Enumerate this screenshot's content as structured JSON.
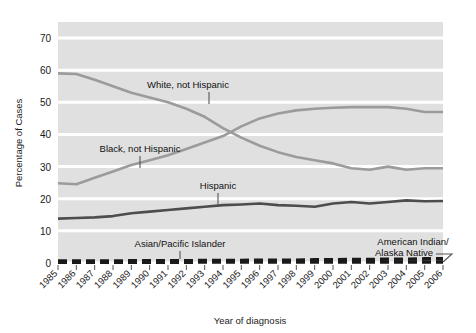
{
  "chart_data": {
    "type": "line",
    "title": "",
    "xlabel": "Year of diagnosis",
    "ylabel": "Percentage of Cases",
    "xlim": [
      1985,
      2006
    ],
    "ylim": [
      0,
      75
    ],
    "yticks": [
      0,
      10,
      20,
      30,
      40,
      50,
      60,
      70
    ],
    "grid": true,
    "legend_position": "inline-annotations",
    "categories": [
      "1985",
      "1986",
      "1987",
      "1988",
      "1989",
      "1990",
      "1991",
      "1992",
      "1993",
      "1994",
      "1995",
      "1996",
      "1997",
      "1998",
      "1999",
      "2000",
      "2001",
      "2002",
      "2003",
      "2004",
      "2005",
      "2006"
    ],
    "series": [
      {
        "name": "White, not Hispanic",
        "color": "#9b9b9b",
        "values": [
          59.0,
          58.8,
          57.0,
          55.0,
          53.0,
          51.5,
          50.0,
          48.0,
          45.5,
          42.0,
          39.0,
          36.5,
          34.5,
          33.0,
          32.0,
          31.0,
          29.5,
          29.0,
          30.0,
          29.0,
          29.5,
          29.5
        ]
      },
      {
        "name": "Black, not Hispanic",
        "color": "#9b9b9b",
        "values": [
          24.8,
          24.5,
          26.5,
          28.5,
          30.5,
          32.0,
          33.5,
          35.5,
          37.5,
          39.5,
          42.5,
          45.0,
          46.5,
          47.5,
          48.0,
          48.3,
          48.5,
          48.5,
          48.5,
          48.0,
          47.0,
          47.0
        ]
      },
      {
        "name": "Hispanic",
        "color": "#4d4d4d",
        "values": [
          13.8,
          14.0,
          14.2,
          14.6,
          15.5,
          16.0,
          16.5,
          17.0,
          17.5,
          18.0,
          18.2,
          18.5,
          18.0,
          17.8,
          17.5,
          18.5,
          19.0,
          18.5,
          19.0,
          19.5,
          19.2,
          19.3
        ]
      },
      {
        "name": "Asian/Pacific Islander",
        "color": "#1a1a1a",
        "values": [
          0.6,
          0.6,
          0.6,
          0.6,
          0.7,
          0.7,
          0.7,
          0.7,
          0.8,
          0.8,
          0.8,
          0.9,
          0.9,
          0.9,
          1.0,
          1.0,
          1.1,
          1.1,
          1.2,
          1.2,
          1.3,
          1.3
        ]
      },
      {
        "name": "American Indian/Alaska Native",
        "color": "#1a1a1a",
        "values": [
          0.2,
          0.2,
          0.2,
          0.2,
          0.2,
          0.2,
          0.2,
          0.2,
          0.3,
          0.3,
          0.3,
          0.3,
          0.3,
          0.3,
          0.3,
          0.3,
          0.3,
          0.3,
          0.3,
          0.3,
          0.3,
          0.3
        ]
      }
    ],
    "annotations": [
      {
        "text": "White, not Hispanic",
        "series": "White, not Hispanic"
      },
      {
        "text": "Black, not Hispanic",
        "series": "Black, not Hispanic"
      },
      {
        "text": "Hispanic",
        "series": "Hispanic"
      },
      {
        "text": "Asian/Pacific Islander",
        "series": "Asian/Pacific Islander"
      },
      {
        "text": "American Indian/",
        "series": "American Indian/Alaska Native"
      },
      {
        "text": "Alaska Native",
        "series": "American Indian/Alaska Native"
      }
    ]
  },
  "labels": {
    "y_axis_title": "Percentage of Cases",
    "x_axis_title": "Year of diagnosis",
    "ytick_0": "0",
    "ytick_10": "10",
    "ytick_20": "20",
    "ytick_30": "30",
    "ytick_40": "40",
    "ytick_50": "50",
    "ytick_60": "60",
    "ytick_70": "70",
    "series_white": "White, not Hispanic",
    "series_black": "Black, not Hispanic",
    "series_hispanic": "Hispanic",
    "series_asian": "Asian/Pacific Islander",
    "series_ai_line1": "American Indian/",
    "series_ai_line2": "Alaska Native",
    "year_1985": "1985",
    "year_1986": "1986",
    "year_1987": "1987",
    "year_1988": "1988",
    "year_1989": "1989",
    "year_1990": "1990",
    "year_1991": "1991",
    "year_1992": "1992",
    "year_1993": "1993",
    "year_1994": "1994",
    "year_1995": "1995",
    "year_1996": "1996",
    "year_1997": "1997",
    "year_1998": "1998",
    "year_1999": "1999",
    "year_2000": "2000",
    "year_2001": "2001",
    "year_2002": "2002",
    "year_2003": "2003",
    "year_2004": "2004",
    "year_2005": "2005",
    "year_2006": "2006"
  },
  "colors": {
    "plot_background": "#e0e0e0",
    "gridline": "#ffffff",
    "light_series": "#9b9b9b",
    "mid_series": "#4d4d4d",
    "dark_series": "#1a1a1a",
    "text": "#1a1a1a",
    "page_background": "#ffffff"
  }
}
